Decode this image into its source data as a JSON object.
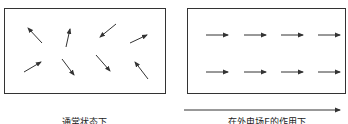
{
  "panels": [
    {
      "id": "normal-state",
      "label": "通常状态下",
      "arrows": [
        {
          "x1": 42,
          "y1": 43,
          "x2": 28,
          "y2": 28
        },
        {
          "x1": 66,
          "y1": 47,
          "x2": 70,
          "y2": 29
        },
        {
          "x1": 116,
          "y1": 24,
          "x2": 100,
          "y2": 37
        },
        {
          "x1": 130,
          "y1": 43,
          "x2": 147,
          "y2": 35
        },
        {
          "x1": 24,
          "y1": 72,
          "x2": 41,
          "y2": 62
        },
        {
          "x1": 62,
          "y1": 59,
          "x2": 74,
          "y2": 75
        },
        {
          "x1": 96,
          "y1": 55,
          "x2": 110,
          "y2": 71
        },
        {
          "x1": 148,
          "y1": 79,
          "x2": 135,
          "y2": 62
        }
      ]
    },
    {
      "id": "external-field-state",
      "label": "在外电场E的作用下",
      "arrows": [
        {
          "x1": 206,
          "y1": 35,
          "x2": 228,
          "y2": 35
        },
        {
          "x1": 244,
          "y1": 35,
          "x2": 266,
          "y2": 35
        },
        {
          "x1": 281,
          "y1": 35,
          "x2": 303,
          "y2": 35
        },
        {
          "x1": 318,
          "y1": 35,
          "x2": 340,
          "y2": 35
        },
        {
          "x1": 206,
          "y1": 72,
          "x2": 228,
          "y2": 72
        },
        {
          "x1": 244,
          "y1": 72,
          "x2": 266,
          "y2": 72
        },
        {
          "x1": 281,
          "y1": 72,
          "x2": 303,
          "y2": 72
        },
        {
          "x1": 318,
          "y1": 72,
          "x2": 340,
          "y2": 72
        }
      ]
    }
  ],
  "field_arrow": {
    "x1": 184,
    "y1": 110,
    "x2": 340,
    "y2": 110,
    "meaning": "external electric field E direction"
  },
  "colors": {
    "stroke": "#333333",
    "text": "#222222"
  }
}
